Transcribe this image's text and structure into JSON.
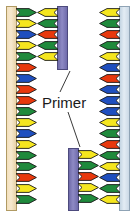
{
  "figure": {
    "type": "dna-primer-annealing-diagram",
    "label": "Primer",
    "background_color": "#ffffff"
  },
  "colors": {
    "template_left_strand": "#f3e0bc",
    "template_right_strand": "#cbd9e6",
    "primer": "#8e8ac4",
    "base_green": "#1f8a3c",
    "base_yellow": "#f5e61f",
    "base_red": "#e8380d",
    "base_blue": "#1f4fbf",
    "outline": "#1a1a1a",
    "label_text": "#1a1a1a",
    "leader_line": "#3a3a3a"
  },
  "strands": {
    "template_left": {
      "name": "left-template-strand",
      "backbone_color": "#f3e0bc",
      "direction": "right",
      "bases": [
        {
          "color": "#1f8a3c",
          "y": 8
        },
        {
          "color": "#f5e61f",
          "y": 19
        },
        {
          "color": "#1f4fbf",
          "y": 30
        },
        {
          "color": "#f5e61f",
          "y": 41
        },
        {
          "color": "#1f8a3c",
          "y": 52
        },
        {
          "color": "#e8380d",
          "y": 63
        },
        {
          "color": "#1f4fbf",
          "y": 74
        },
        {
          "color": "#e8380d",
          "y": 85
        },
        {
          "color": "#e8380d",
          "y": 96
        },
        {
          "color": "#1f8a3c",
          "y": 107
        },
        {
          "color": "#f5e61f",
          "y": 118
        },
        {
          "color": "#1f4fbf",
          "y": 129
        },
        {
          "color": "#f5e61f",
          "y": 140
        },
        {
          "color": "#1f8a3c",
          "y": 151
        },
        {
          "color": "#1f8a3c",
          "y": 162
        },
        {
          "color": "#e8380d",
          "y": 173
        },
        {
          "color": "#f5e61f",
          "y": 184
        },
        {
          "color": "#1f8a3c",
          "y": 195
        }
      ]
    },
    "primer_top": {
      "name": "top-primer-strand",
      "backbone_color": "#8e8ac4",
      "direction": "left",
      "bases": [
        {
          "color": "#f5e61f",
          "y": 8
        },
        {
          "color": "#1f8a3c",
          "y": 19
        },
        {
          "color": "#e8380d",
          "y": 30
        },
        {
          "color": "#1f8a3c",
          "y": 41
        },
        {
          "color": "#f5e61f",
          "y": 52
        }
      ]
    },
    "primer_bottom": {
      "name": "bottom-primer-strand",
      "backbone_color": "#8e8ac4",
      "direction": "right",
      "bases": [
        {
          "color": "#f5e61f",
          "y": 150
        },
        {
          "color": "#1f8a3c",
          "y": 161
        },
        {
          "color": "#e8380d",
          "y": 172
        },
        {
          "color": "#f5e61f",
          "y": 183
        },
        {
          "color": "#1f8a3c",
          "y": 194
        }
      ]
    },
    "template_right": {
      "name": "right-template-strand",
      "backbone_color": "#cbd9e6",
      "direction": "left",
      "bases": [
        {
          "color": "#f5e61f",
          "y": 8
        },
        {
          "color": "#1f8a3c",
          "y": 19
        },
        {
          "color": "#e8380d",
          "y": 30
        },
        {
          "color": "#1f8a3c",
          "y": 41
        },
        {
          "color": "#f5e61f",
          "y": 52
        },
        {
          "color": "#1f4fbf",
          "y": 63
        },
        {
          "color": "#e8380d",
          "y": 74
        },
        {
          "color": "#1f4fbf",
          "y": 85
        },
        {
          "color": "#1f4fbf",
          "y": 96
        },
        {
          "color": "#1f4fbf",
          "y": 107
        },
        {
          "color": "#f5e61f",
          "y": 118
        },
        {
          "color": "#1f8a3c",
          "y": 129
        },
        {
          "color": "#e8380d",
          "y": 140
        },
        {
          "color": "#1f8a3c",
          "y": 151
        },
        {
          "color": "#f5e61f",
          "y": 162
        },
        {
          "color": "#1f4fbf",
          "y": 173
        },
        {
          "color": "#1f8a3c",
          "y": 184
        },
        {
          "color": "#f5e61f",
          "y": 195
        }
      ]
    }
  },
  "leaders": [
    {
      "name": "leader-to-top-primer",
      "x1": 60,
      "y1": 92,
      "x2": 70,
      "y2": 71
    },
    {
      "name": "leader-to-bottom-primer",
      "x1": 68,
      "y1": 112,
      "x2": 80,
      "y2": 147
    }
  ]
}
